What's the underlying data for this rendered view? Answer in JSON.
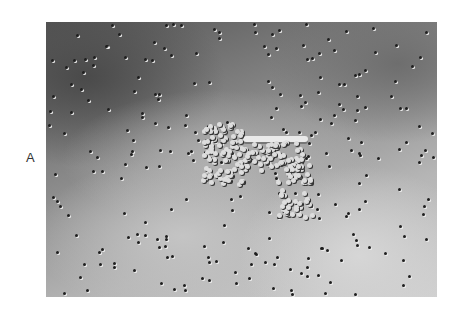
{
  "figure": {
    "panel_label": "A",
    "image": {
      "kind": "microscopy",
      "description": "Grayscale micrograph showing scattered small particles/cells on a textured background with a central clustered colony"
    }
  }
}
